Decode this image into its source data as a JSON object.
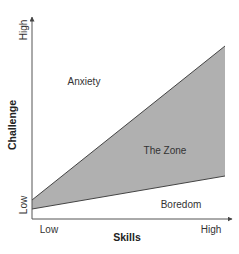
{
  "diagram": {
    "type": "flow-zone-diagram",
    "colors": {
      "zone_fill": "#b0b0b0",
      "axis": "#555555",
      "boundary_line": "#444444",
      "text": "#333333"
    },
    "y_axis": {
      "title": "Challenge",
      "high_label": "High",
      "low_label": "Low"
    },
    "x_axis": {
      "title": "Skills",
      "low_label": "Low",
      "high_label": "High"
    },
    "regions": {
      "upper": "Anxiety",
      "middle": "The Zone",
      "lower": "Boredom"
    },
    "boundaries": {
      "upper_line": {
        "start": [
          32,
          200
        ],
        "end": [
          225,
          46
        ]
      },
      "lower_line": {
        "start": [
          32,
          209
        ],
        "end": [
          225,
          176
        ]
      }
    }
  }
}
